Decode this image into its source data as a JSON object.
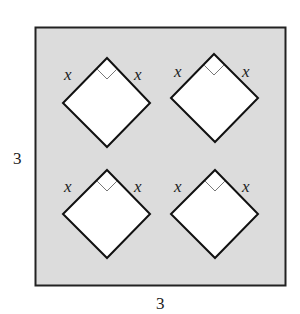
{
  "figure": {
    "outer_square": {
      "side_label_left": "3",
      "side_label_bottom": "3",
      "fill": "#dcdcdc",
      "stroke": "#222222"
    },
    "diamonds": [
      {
        "id": "top-left",
        "left_label": "x",
        "right_label": "x",
        "right_angle_marker": true
      },
      {
        "id": "top-right",
        "left_label": "x",
        "right_label": "x",
        "right_angle_marker": true
      },
      {
        "id": "bottom-left",
        "left_label": "x",
        "right_label": "x",
        "right_angle_marker": true
      },
      {
        "id": "bottom-right",
        "left_label": "x",
        "right_label": "x",
        "right_angle_marker": true
      }
    ],
    "diamond_fill": "#ffffff"
  }
}
